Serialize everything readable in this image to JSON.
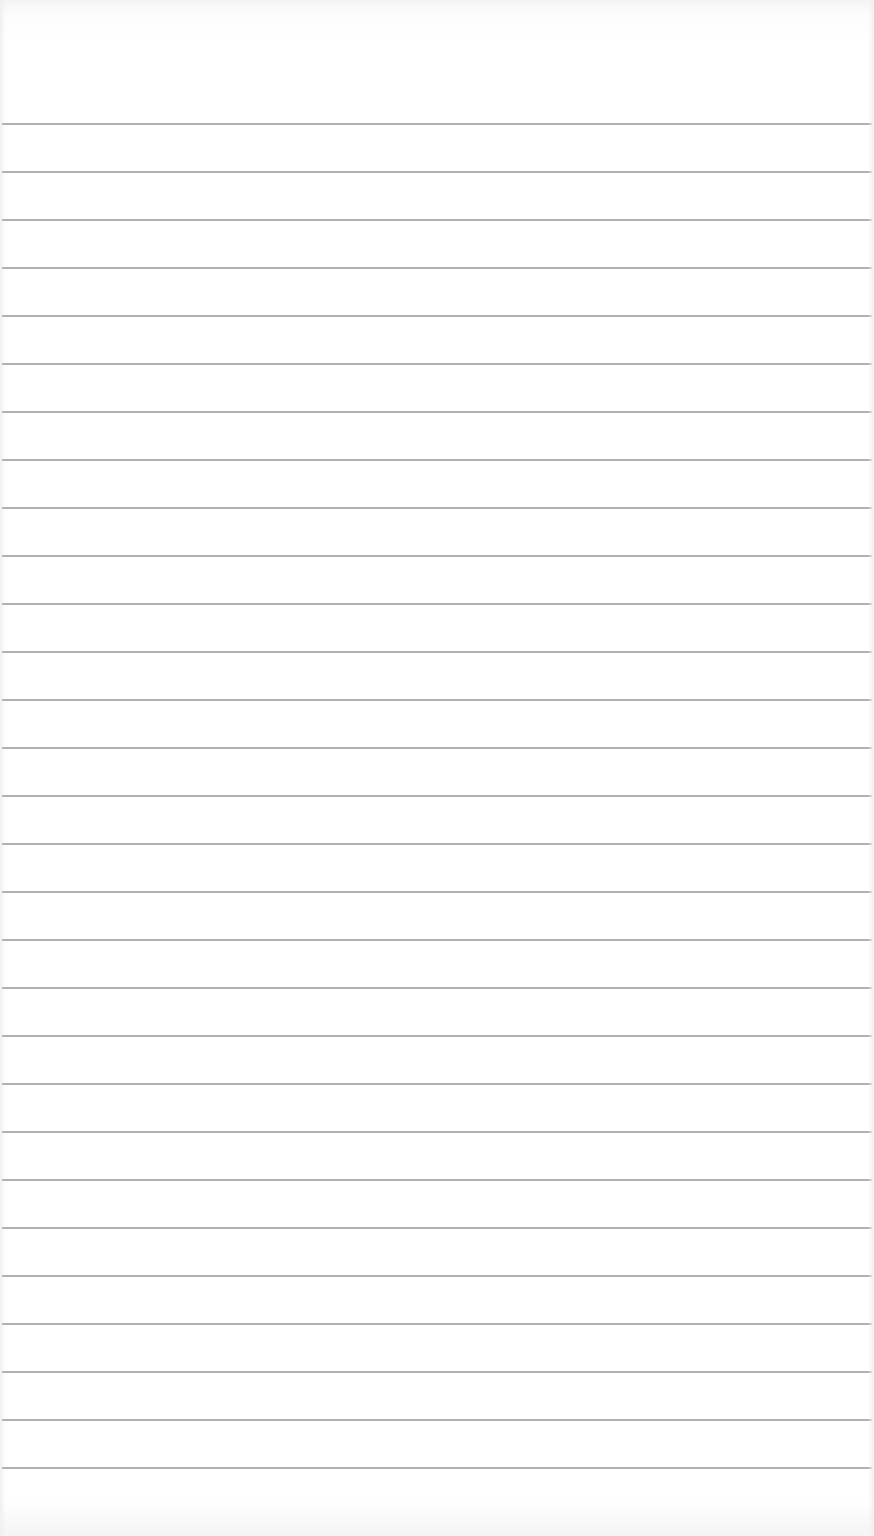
{
  "paper": {
    "type": "ruled-notebook-page",
    "line_count": 29,
    "first_line_y": 124,
    "line_spacing": 48,
    "line_color": "#a9a9a9",
    "background_color": "#ffffff"
  }
}
